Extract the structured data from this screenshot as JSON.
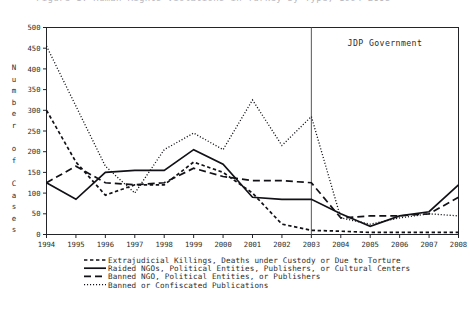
{
  "figure": {
    "cut_off_top_text": "Figure 1. Human Rights Violations in Turkey by Type, 1994-2008",
    "annotation": "JDP Government",
    "annotation_year": 2003
  },
  "chart_data": {
    "type": "line",
    "title": "",
    "xlabel": "",
    "ylabel": "Number of Cases",
    "xlim": [
      1994,
      2008
    ],
    "ylim": [
      0,
      500
    ],
    "ytick_step": 50,
    "grid": false,
    "legend_position": "below",
    "x": [
      1994,
      1995,
      1996,
      1997,
      1998,
      1999,
      2000,
      2001,
      2002,
      2003,
      2004,
      2005,
      2006,
      2007,
      2008
    ],
    "yticks": [
      0,
      50,
      100,
      150,
      200,
      250,
      300,
      350,
      400,
      450,
      500
    ],
    "xticklabels": [
      "1994",
      "1995",
      "1996",
      "1997",
      "1998",
      "1999",
      "2000",
      "2001",
      "2002",
      "2003",
      "2004",
      "2005",
      "2006",
      "2007",
      "2008"
    ],
    "series": [
      {
        "name": "Extrajudicial Killings, Deaths under Custody or Due to Torture",
        "style": "short-dashed",
        "values": [
          300,
          175,
          95,
          120,
          120,
          175,
          150,
          100,
          25,
          10,
          8,
          5,
          5,
          5,
          5
        ]
      },
      {
        "name": "Raided NGOs, Political Entities, Publishers, or Cultural Centers",
        "style": "solid",
        "values": [
          125,
          85,
          150,
          155,
          155,
          205,
          170,
          90,
          85,
          85,
          50,
          20,
          45,
          55,
          120
        ]
      },
      {
        "name": "Banned NGO, Political Entities, or Publishers",
        "style": "dashed",
        "values": [
          125,
          165,
          125,
          120,
          125,
          160,
          140,
          130,
          130,
          125,
          40,
          45,
          45,
          50,
          90
        ]
      },
      {
        "name": "Banned or Confiscated Publications",
        "style": "dotted",
        "values": [
          455,
          310,
          165,
          100,
          205,
          245,
          205,
          325,
          215,
          285,
          40,
          25,
          40,
          50,
          45
        ]
      }
    ]
  },
  "legend": {
    "items": [
      {
        "label": "Extrajudicial Killings, Deaths under Custody or Due to Torture",
        "style": "short-dashed"
      },
      {
        "label": "Raided NGOs, Political Entities, Publishers, or Cultural Centers",
        "style": "solid"
      },
      {
        "label": "Banned NGO, Political Entities, or Publishers",
        "style": "dashed"
      },
      {
        "label": "Banned or Confiscated Publications",
        "style": "dotted"
      }
    ]
  }
}
